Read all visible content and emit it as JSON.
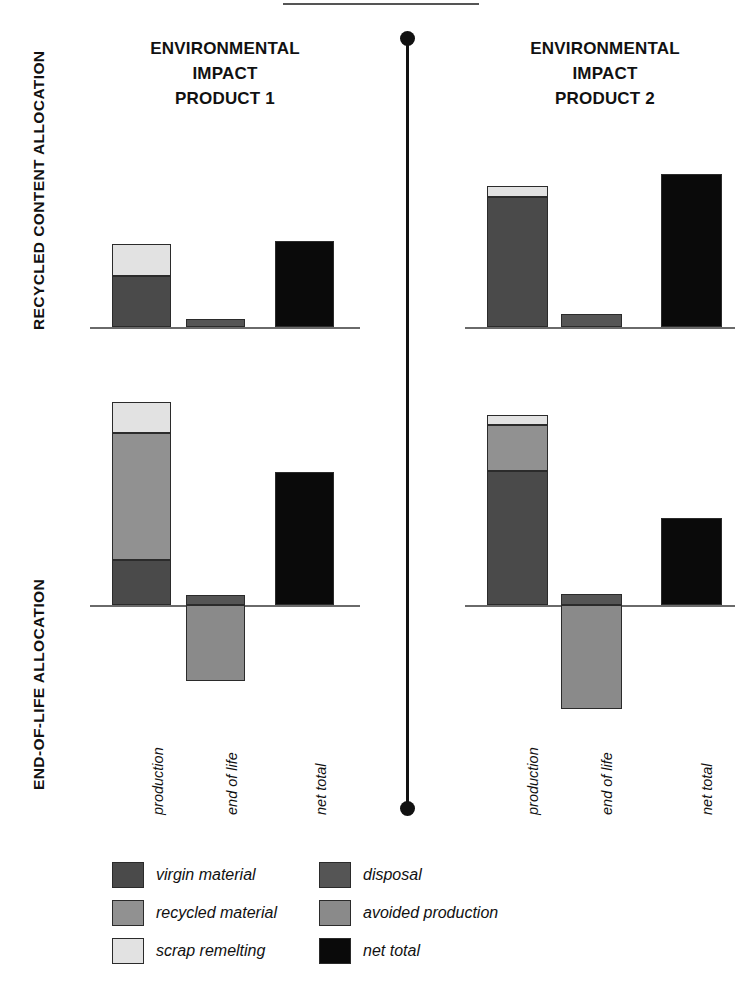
{
  "figure": {
    "side_titles": {
      "recycled": "RECYCLED CONTENT ALLOCATION",
      "end_of_life": "END-OF-LIFE ALLOCATION"
    },
    "panel_titles": {
      "product1": "ENVIRONMENTAL\nIMPACT\nPRODUCT 1",
      "product1_line1": "ENVIRONMENTAL",
      "product1_line2": "IMPACT",
      "product1_line3": "PRODUCT 1",
      "product2_line1": "ENVIRONMENTAL",
      "product2_line2": "IMPACT",
      "product2_line3": "PRODUCT 2"
    }
  },
  "legend": {
    "left_column": [
      {
        "label": "virgin material",
        "color": "#4a4a4a",
        "key": "virgin_material"
      },
      {
        "label": "recycled material",
        "color": "#919191",
        "key": "recycled_material"
      },
      {
        "label": "scrap remelting",
        "color": "#e2e2e2",
        "key": "scrap_remelting"
      }
    ],
    "right_column": [
      {
        "label": "disposal",
        "color": "#555555",
        "key": "disposal"
      },
      {
        "label": "avoided production",
        "color": "#8a8a8a",
        "key": "avoided_production"
      },
      {
        "label": "net total",
        "color": "#0a0a0a",
        "key": "net_total"
      }
    ]
  },
  "colors": {
    "virgin_material": "#4a4a4a",
    "recycled_material": "#919191",
    "scrap_remelting": "#e2e2e2",
    "disposal": "#555555",
    "avoided_production": "#8a8a8a",
    "net_total": "#0a0a0a",
    "axis": "#6a6a6a",
    "outline": "#2b2b2b"
  },
  "categories": [
    "production",
    "end of life",
    "net total"
  ],
  "chart_data": [
    {
      "id": "p1-recycled-content",
      "type": "bar",
      "title": "ENVIRONMENTAL IMPACT PRODUCT 1",
      "row_label": "RECYCLED CONTENT ALLOCATION",
      "xlabel": "",
      "ylabel": "environmental impact",
      "categories": [
        "production",
        "end of life",
        "net total"
      ],
      "stacked": true,
      "ylim": [
        -60,
        100
      ],
      "grid": false,
      "legend_position": "bottom",
      "bars": [
        {
          "category": "production",
          "segments": [
            {
              "name": "virgin material",
              "value": 52
            },
            {
              "name": "scrap remelting",
              "value": 33
            }
          ]
        },
        {
          "category": "end of life",
          "segments": [
            {
              "name": "disposal",
              "value": 8
            }
          ]
        },
        {
          "category": "net total",
          "segments": [
            {
              "name": "net total",
              "value": 88
            }
          ]
        }
      ]
    },
    {
      "id": "p2-recycled-content",
      "type": "bar",
      "title": "ENVIRONMENTAL IMPACT PRODUCT 2",
      "row_label": "RECYCLED CONTENT ALLOCATION",
      "xlabel": "",
      "ylabel": "environmental impact",
      "categories": [
        "production",
        "end of life",
        "net total"
      ],
      "stacked": true,
      "ylim": [
        -60,
        100
      ],
      "grid": false,
      "legend_position": "bottom",
      "bars": [
        {
          "category": "production",
          "segments": [
            {
              "name": "virgin material",
              "value": 133
            },
            {
              "name": "scrap remelting",
              "value": 11
            }
          ]
        },
        {
          "category": "end of life",
          "segments": [
            {
              "name": "disposal",
              "value": 13
            }
          ]
        },
        {
          "category": "net total",
          "segments": [
            {
              "name": "net total",
              "value": 156
            }
          ]
        }
      ]
    },
    {
      "id": "p1-end-of-life",
      "type": "bar",
      "title": "ENVIRONMENTAL IMPACT PRODUCT 1",
      "row_label": "END-OF-LIFE ALLOCATION",
      "xlabel": "",
      "ylabel": "environmental impact",
      "categories": [
        "production",
        "end of life",
        "net total"
      ],
      "stacked": true,
      "ylim": [
        -90,
        220
      ],
      "grid": false,
      "legend_position": "bottom",
      "bars": [
        {
          "category": "production",
          "segments": [
            {
              "name": "virgin material",
              "value": 46
            },
            {
              "name": "recycled material",
              "value": 129
            },
            {
              "name": "scrap remelting",
              "value": 32
            }
          ]
        },
        {
          "category": "end of life",
          "segments": [
            {
              "name": "disposal",
              "value": 10
            },
            {
              "name": "avoided production",
              "value": -78
            }
          ]
        },
        {
          "category": "net total",
          "segments": [
            {
              "name": "net total",
              "value": 136
            }
          ]
        }
      ]
    },
    {
      "id": "p2-end-of-life",
      "type": "bar",
      "title": "ENVIRONMENTAL IMPACT PRODUCT 2",
      "row_label": "END-OF-LIFE ALLOCATION",
      "xlabel": "",
      "ylabel": "environmental impact",
      "categories": [
        "production",
        "end of life",
        "net total"
      ],
      "stacked": true,
      "ylim": [
        -90,
        220
      ],
      "grid": false,
      "legend_position": "bottom",
      "bars": [
        {
          "category": "production",
          "segments": [
            {
              "name": "virgin material",
              "value": 137
            },
            {
              "name": "recycled material",
              "value": 47
            },
            {
              "name": "scrap remelting",
              "value": 10
            }
          ]
        },
        {
          "category": "end of life",
          "segments": [
            {
              "name": "disposal",
              "value": 11
            },
            {
              "name": "avoided production",
              "value": -106
            }
          ]
        },
        {
          "category": "net total",
          "segments": [
            {
              "name": "net total",
              "value": 89
            }
          ]
        }
      ]
    }
  ]
}
